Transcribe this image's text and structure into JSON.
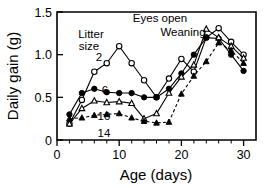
{
  "chart_data": {
    "type": "line",
    "title": "",
    "xlabel": "Age (days)",
    "ylabel": "Daily gain (g)",
    "xlim": [
      0,
      32
    ],
    "ylim": [
      0,
      1.5
    ],
    "xticks": [
      0,
      10,
      20,
      30
    ],
    "xtick_labels": [
      "0",
      "10",
      "20",
      "30"
    ],
    "xticks_minor": [
      2,
      4,
      6,
      8,
      12,
      14,
      16,
      18,
      22,
      24,
      26,
      28,
      32
    ],
    "yticks": [
      0,
      0.5,
      1.0,
      1.5
    ],
    "ytick_labels": [
      "0",
      "0.5",
      "1.0",
      "1.5"
    ],
    "grid": false,
    "legend_position": "inline-labels",
    "legend_title": "Litter size",
    "series": [
      {
        "name": "2",
        "label": "2",
        "marker": "open-circle",
        "linestyle": "solid",
        "x": [
          2,
          4,
          6,
          8,
          10,
          12,
          14,
          16,
          18,
          20,
          22,
          24,
          26,
          28,
          30
        ],
        "values": [
          0.19,
          0.47,
          0.8,
          0.9,
          1.1,
          0.9,
          0.7,
          0.5,
          0.72,
          0.95,
          0.8,
          1.2,
          1.31,
          1.15,
          1.0
        ]
      },
      {
        "name": "6",
        "label": "6",
        "marker": "filled-circle",
        "linestyle": "solid",
        "x": [
          2,
          4,
          6,
          8,
          10,
          12,
          14,
          16,
          18,
          20,
          22,
          24,
          26,
          28,
          30
        ],
        "values": [
          0.3,
          0.55,
          0.6,
          0.56,
          0.55,
          0.55,
          0.5,
          0.5,
          0.6,
          0.78,
          1.0,
          1.2,
          1.19,
          1.0,
          0.81
        ]
      },
      {
        "name": "10",
        "label": "10",
        "marker": "open-triangle",
        "linestyle": "solid",
        "x": [
          2,
          4,
          6,
          8,
          10,
          12,
          14,
          16,
          18,
          20,
          22,
          24,
          26,
          28,
          30
        ],
        "values": [
          0.19,
          0.37,
          0.46,
          0.44,
          0.45,
          0.43,
          0.25,
          0.31,
          0.55,
          0.74,
          0.88,
          1.3,
          1.2,
          1.1,
          0.96
        ]
      },
      {
        "name": "14",
        "label": "14",
        "marker": "filled-triangle",
        "linestyle": "dashed",
        "x": [
          2,
          4,
          6,
          8,
          10,
          12,
          14,
          16,
          18,
          20,
          22,
          24,
          26,
          28,
          30
        ],
        "values": [
          0.25,
          0.26,
          0.29,
          0.3,
          0.31,
          0.26,
          0.22,
          0.2,
          0.21,
          0.54,
          0.75,
          0.92,
          1.14,
          1.05,
          0.9
        ]
      }
    ],
    "annotations": [
      {
        "text": "Eyes open",
        "x": 12,
        "arrow": "down"
      },
      {
        "text": "Weaning",
        "x": 15,
        "arrow": "down"
      }
    ]
  }
}
